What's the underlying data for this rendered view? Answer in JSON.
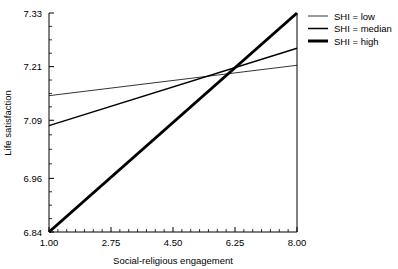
{
  "chart_data": {
    "type": "line",
    "title": "",
    "xlabel": "Social-religious engagement",
    "ylabel": "Life satisfaction",
    "xlim": [
      1.0,
      8.0
    ],
    "ylim": [
      6.84,
      7.33
    ],
    "xticks": [
      "1.00",
      "2.75",
      "4.50",
      "6.25",
      "8.00"
    ],
    "xtick_values": [
      1.0,
      2.75,
      4.5,
      6.25,
      8.0
    ],
    "yticks": [
      "6.84",
      "6.96",
      "7.09",
      "7.21",
      "7.33"
    ],
    "ytick_values": [
      6.84,
      6.96,
      7.09,
      7.21,
      7.33
    ],
    "grid": false,
    "legend_position": "upper right",
    "minor_ticks": true,
    "series": [
      {
        "name": "SHI = low",
        "x": [
          1.0,
          8.0
        ],
        "values": [
          7.145,
          7.213
        ],
        "linewidth": 0.8,
        "color": "#000000"
      },
      {
        "name": "SHI = median",
        "x": [
          1.0,
          8.0
        ],
        "values": [
          7.078,
          7.251
        ],
        "linewidth": 1.5,
        "color": "#000000"
      },
      {
        "name": "SHI = high",
        "x": [
          1.0,
          8.0
        ],
        "values": [
          6.84,
          7.33
        ],
        "linewidth": 3.0,
        "color": "#000000"
      }
    ],
    "annotations": []
  },
  "legend": {
    "entries": [
      {
        "label": "SHI = low"
      },
      {
        "label": "SHI = median"
      },
      {
        "label": "SHI = high"
      }
    ]
  },
  "axes": {
    "x_title": "Social-religious engagement",
    "y_title": "Life satisfaction",
    "x_tick_labels": [
      "1.00",
      "2.75",
      "4.50",
      "6.25",
      "8.00"
    ],
    "y_tick_labels": [
      "6.84",
      "6.96",
      "7.09",
      "7.21",
      "7.33"
    ]
  },
  "colors": {
    "axis": "#000000",
    "line": "#000000",
    "background": "#ffffff"
  }
}
